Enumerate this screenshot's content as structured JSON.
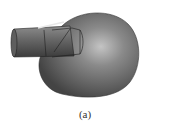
{
  "figure": {
    "caption": "(a)",
    "colors": {
      "surface": "#6e6e6e",
      "highlight": "#b8b8b8",
      "shadow": "#3a3a3a",
      "outline": "#222222"
    }
  }
}
